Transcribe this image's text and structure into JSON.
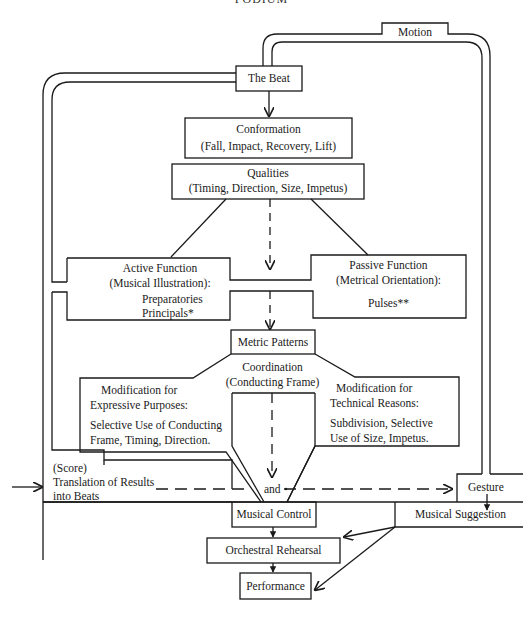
{
  "title": "PODIUM",
  "nodes": {
    "motion": "Motion",
    "beat": "The Beat",
    "conformation": {
      "line1": "Conformation",
      "line2": "(Fall, Impact, Recovery, Lift)"
    },
    "qualities": {
      "line1": "Qualities",
      "line2": "(Timing, Direction, Size, Impetus)"
    },
    "active": {
      "line1": "Active Function",
      "line2": "(Musical Illustration):",
      "line3": "Preparatories",
      "line4": "Principals*"
    },
    "passive": {
      "line1": "Passive Function",
      "line2": "(Metrical Orientation):",
      "line3": "Pulses**"
    },
    "metric": "Metric Patterns",
    "coordination": {
      "line1": "Coordination",
      "line2": "(Conducting Frame)"
    },
    "expressive": {
      "line1": "Modification for",
      "line2": "Expressive Purposes:",
      "line3": "Selective Use  of Conducting",
      "line4": "Frame, Timing,  Direction."
    },
    "technical": {
      "line1": "Modification for",
      "line2": "Technical Reasons:",
      "line3": "Subdivision,  Selective",
      "line4": "Use  of Size,  Impetus."
    },
    "score": {
      "line1": "(Score)",
      "line2": "Translation of Results",
      "line3": "into Beats"
    },
    "and": "and",
    "gesture": "Gesture",
    "musical_control": "Musical Control",
    "musical_suggestion": "Musical Suggestion",
    "rehearsal": "Orchestral Rehearsal",
    "performance": "Performance"
  },
  "colors": {
    "line": "#1a1a1a",
    "background": "#ffffff"
  }
}
